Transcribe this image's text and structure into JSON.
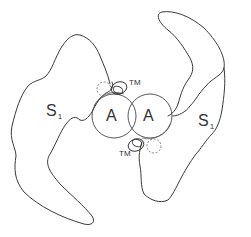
{
  "diagram": {
    "left_subunit": {
      "region_label": "S",
      "region_subscript": "1",
      "domain_label": "A",
      "tm_label": "TM"
    },
    "right_subunit": {
      "region_label": "S",
      "region_subscript": "1",
      "domain_label": "A",
      "tm_label": "TM"
    },
    "colors": {
      "stroke": "#3a3a3a",
      "dashed": "#777777",
      "background": "#ffffff"
    }
  }
}
